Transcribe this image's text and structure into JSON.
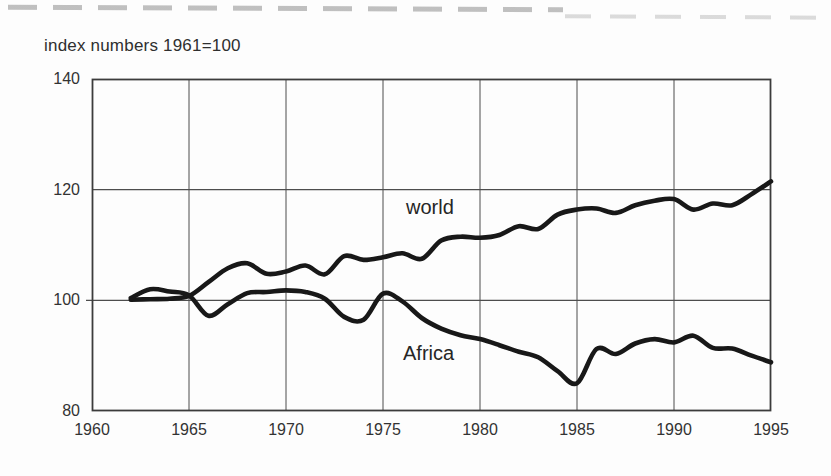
{
  "chart_data": {
    "type": "line",
    "title": "index numbers 1961=100",
    "xlabel": "",
    "ylabel": "",
    "xlim": [
      1960,
      1995
    ],
    "ylim": [
      80,
      140
    ],
    "x_tick_labels": [
      "1960",
      "1965",
      "1970",
      "1975",
      "1980",
      "1985",
      "1990",
      "1995"
    ],
    "y_tick_labels": [
      "140",
      "120",
      "100",
      "80"
    ],
    "y_tick_values": [
      140,
      120,
      100,
      80
    ],
    "x_tick_values": [
      1960,
      1965,
      1970,
      1975,
      1980,
      1985,
      1990,
      1995
    ],
    "grid": "full vertical gridlines each 5 years; horizontal gridlines at 100 and 120",
    "baseline_value": 100,
    "line_color": "#181818",
    "grid_color": "#4d4d4d",
    "frame_color": "#3c3c3c",
    "x": [
      1962,
      1963,
      1964,
      1965,
      1966,
      1967,
      1968,
      1969,
      1970,
      1971,
      1972,
      1973,
      1974,
      1975,
      1976,
      1977,
      1978,
      1979,
      1980,
      1981,
      1982,
      1983,
      1984,
      1985,
      1986,
      1987,
      1988,
      1989,
      1990,
      1991,
      1992,
      1993,
      1994,
      1995
    ],
    "series": [
      {
        "name": "world",
        "values": [
          100.1,
          100.2,
          100.3,
          100.8,
          103.3,
          105.8,
          106.7,
          104.8,
          105.2,
          106.3,
          104.7,
          108.0,
          107.3,
          107.8,
          108.5,
          107.5,
          110.8,
          111.5,
          111.3,
          111.8,
          113.4,
          112.9,
          115.5,
          116.4,
          116.6,
          115.8,
          117.2,
          118.0,
          118.3,
          116.4,
          117.5,
          117.2,
          119.2,
          121.5
        ]
      },
      {
        "name": "Africa",
        "values": [
          100.4,
          102.0,
          101.6,
          100.9,
          97.2,
          99.3,
          101.3,
          101.5,
          101.8,
          101.5,
          100.3,
          97.0,
          96.5,
          101.2,
          99.8,
          96.8,
          94.9,
          93.7,
          93.0,
          91.9,
          90.7,
          89.7,
          87.2,
          85.0,
          91.2,
          90.3,
          92.2,
          93.0,
          92.4,
          93.6,
          91.4,
          91.3,
          90.0,
          88.8
        ]
      }
    ],
    "legend_position": "inline labels next to lines"
  }
}
